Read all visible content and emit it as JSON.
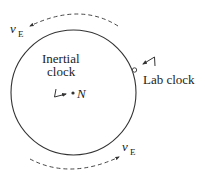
{
  "diagram": {
    "labels": {
      "inertial_line1": "Inertial",
      "inertial_line2": "clock",
      "lab_clock": "Lab clock",
      "center_point": "N",
      "velocity_symbol": "v",
      "velocity_subscript": "E"
    },
    "colors": {
      "stroke": "#333333",
      "text": "#222222",
      "background": "#ffffff"
    }
  }
}
